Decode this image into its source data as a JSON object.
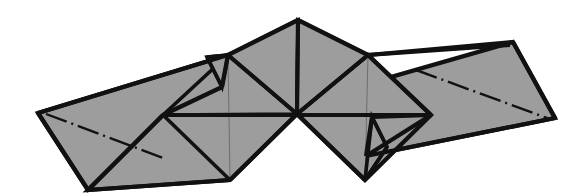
{
  "figure": {
    "canvas": {
      "width": 582,
      "height": 195
    },
    "colors": {
      "background": "#ffffff",
      "facet_fill": "#9d9d9d",
      "facet_fill_alt": "#a3a3a3",
      "outline_stroke": "#111111",
      "hidden_edge_stroke": "#6e6e6e",
      "center_line_stroke": "#111111"
    },
    "stroke_widths": {
      "outline": 4.2,
      "facet_edge": 3.6,
      "hidden_edge": 1.0,
      "center_line": 2.4
    },
    "center_vertex": {
      "x": 297,
      "y": 114
    },
    "apex_vertex": {
      "x": 298,
      "y": 20
    },
    "symmetry": "180-degree rotational about center vertex",
    "center_line_dash_pattern": "22 5 2 5",
    "facets": [
      {
        "name": "left-outer-wing",
        "points": "38,113 228,55 276,98 88,190"
      },
      {
        "name": "left-lower-panel",
        "points": "88,190 163,115 297,114 230,180"
      },
      {
        "name": "left-lower-panel-inner",
        "points": "163,115 297,114 230,180"
      },
      {
        "name": "left-upper-triangle",
        "points": "163,115 228,55 297,114"
      },
      {
        "name": "left-apex-triangle",
        "points": "228,55 298,20 297,114"
      },
      {
        "name": "left-narrow-flap",
        "points": "207,57 228,55 222,87"
      },
      {
        "name": "right-apex-triangle",
        "points": "298,20 368,55 297,114"
      },
      {
        "name": "right-upper-triangle",
        "points": "297,114 368,55 431,115"
      },
      {
        "name": "right-upper-panel",
        "points": "297,114 368,55 431,115 365,180"
      },
      {
        "name": "right-narrow-flap",
        "points": "387,147 365,180 372,117"
      },
      {
        "name": "right-outer-wing",
        "points": "318,98 366,55 555,118 513,42"
      },
      {
        "name": "right-outer-wing-real",
        "points": "555,118 513,42 318,98 366,156"
      }
    ],
    "hidden_edges": [
      {
        "name": "left-hidden-diagonal",
        "points": "228,55 230,180"
      },
      {
        "name": "left-hidden-horizontal",
        "points": "163,115 297,114"
      },
      {
        "name": "right-hidden-diagonal",
        "points": "368,55 365,180"
      },
      {
        "name": "right-hidden-horizontal",
        "points": "297,114 431,115"
      }
    ],
    "center_lines": [
      {
        "name": "left-wing-centerline",
        "points": "46,114 166,159"
      },
      {
        "name": "right-wing-centerline",
        "points": "416,70 547,118"
      }
    ]
  }
}
